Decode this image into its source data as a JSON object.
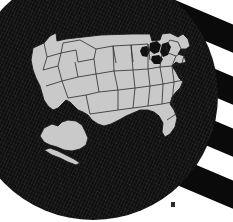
{
  "image": {
    "subject": "united-states-map-patch",
    "background_description": "diagonal black and white flag stripes",
    "patch_description": "dark circular embroidered patch with textured weave",
    "alt_text": "Dark circular patch showing a light gray map of the United States with state borders, over diagonal black and white stripes"
  },
  "colors": {
    "stripe_dark": "#0a0a0a",
    "stripe_light": "#ffffff",
    "patch_fill": "#101010",
    "land_fill": "#c9c9c9",
    "border_stroke": "#2a2a2a",
    "lake_fill": "#101010",
    "dot_fill": "#2b2b2b",
    "page_background": "#ffffff"
  },
  "background": {
    "stripes": [
      {
        "name": "stripe-1",
        "tone": "dark"
      },
      {
        "name": "stripe-2",
        "tone": "dark"
      },
      {
        "name": "stripe-3",
        "tone": "dark"
      },
      {
        "name": "stripe-4",
        "tone": "dark"
      }
    ],
    "stripe_angle_deg": 23
  },
  "patch": {
    "shape": "circle",
    "diameter_px": 250,
    "center_x_px": 93,
    "center_y_px": 95
  },
  "map": {
    "title": "United States",
    "regions": [
      {
        "name": "contiguous-united-states"
      },
      {
        "name": "alaska"
      },
      {
        "name": "great-lakes"
      }
    ],
    "features_shown": [
      "state-borders",
      "florida-peninsula",
      "great-lakes",
      "alaska"
    ]
  },
  "marker": {
    "name": "corner-dot",
    "x_px": 171,
    "y_px": 202
  }
}
